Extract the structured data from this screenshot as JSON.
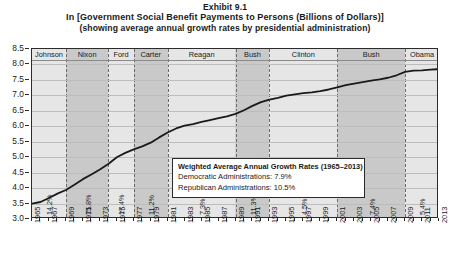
{
  "title": {
    "exhibit": "Exhibit 9.1",
    "main": "In [Government Social Benefit Payments to Persons (Billions of Dollars)]",
    "sub": "(showing average annual growth rates by presidential administration)"
  },
  "legend": {
    "title": "Weighted Average Annual Growth Rates (1965–2013)",
    "democratic": "Democratic Administrations: 7.9%",
    "republican": "Republican Administrations: 10.5%"
  },
  "chart_data": {
    "type": "line",
    "title": "In [Government Social Benefit Payments to Persons (Billions of Dollars)]",
    "subtitle": "(showing average annual growth rates by presidential administration)",
    "xlabel": "",
    "ylabel": "",
    "xlim": [
      1965,
      2013
    ],
    "ylim": [
      3.0,
      8.5
    ],
    "grid": true,
    "legend_position": "inside-center",
    "yticks": [
      "8.5",
      "8.0",
      "7.5",
      "7.0",
      "6.5",
      "6.0",
      "5.5",
      "5.0",
      "4.5",
      "4.0",
      "3.5",
      "3.0"
    ],
    "xticks": [
      "1965",
      "1967",
      "1969",
      "1971",
      "1973",
      "1975",
      "1977",
      "1979",
      "1981",
      "1983",
      "1985",
      "1987",
      "1989",
      "1991",
      "1993",
      "1995",
      "1997",
      "1999",
      "2001",
      "2003",
      "2005",
      "2007",
      "2009",
      "2011",
      "2013"
    ],
    "series": [
      {
        "name": "ln(Government Social Benefit Payments)",
        "color": "#1a1a1a",
        "x": [
          1965,
          1966,
          1967,
          1968,
          1969,
          1970,
          1971,
          1972,
          1973,
          1974,
          1975,
          1976,
          1977,
          1978,
          1979,
          1980,
          1981,
          1982,
          1983,
          1984,
          1985,
          1986,
          1987,
          1988,
          1989,
          1990,
          1991,
          1992,
          1993,
          1994,
          1995,
          1996,
          1997,
          1998,
          1999,
          2000,
          2001,
          2002,
          2003,
          2004,
          2005,
          2006,
          2007,
          2008,
          2009,
          2010,
          2011,
          2012,
          2013
        ],
        "values": [
          3.5,
          3.55,
          3.68,
          3.82,
          3.94,
          4.11,
          4.29,
          4.44,
          4.6,
          4.78,
          5.0,
          5.14,
          5.25,
          5.35,
          5.47,
          5.64,
          5.8,
          5.93,
          6.02,
          6.07,
          6.14,
          6.2,
          6.26,
          6.32,
          6.4,
          6.52,
          6.66,
          6.78,
          6.86,
          6.92,
          6.99,
          7.03,
          7.07,
          7.1,
          7.14,
          7.19,
          7.26,
          7.33,
          7.38,
          7.43,
          7.48,
          7.52,
          7.57,
          7.65,
          7.76,
          7.8,
          7.81,
          7.83,
          7.85
        ]
      }
    ],
    "administrations": [
      {
        "label": "Johnson",
        "party": "Democratic",
        "growth_rate": "14.2%",
        "start": 1965,
        "end": 1969,
        "shade": "light"
      },
      {
        "label": "Nixon",
        "party": "Republican",
        "growth_rate": "15.8%",
        "start": 1969,
        "end": 1974,
        "shade": "dark"
      },
      {
        "label": "Ford",
        "party": "Republican",
        "growth_rate": "17.4%",
        "start": 1974,
        "end": 1977,
        "shade": "light"
      },
      {
        "label": "Carter",
        "party": "Democratic",
        "growth_rate": "11.2%",
        "start": 1977,
        "end": 1981,
        "shade": "dark"
      },
      {
        "label": "Reagan",
        "party": "Republican",
        "growth_rate": "7.3%",
        "start": 1981,
        "end": 1989,
        "shade": "light"
      },
      {
        "label": "Bush",
        "party": "Republican",
        "growth_rate": "11.3%",
        "start": 1989,
        "end": 1993,
        "shade": "dark"
      },
      {
        "label": "Clinton",
        "party": "Democratic",
        "growth_rate": "4.5%",
        "start": 1993,
        "end": 2001,
        "shade": "light"
      },
      {
        "label": "Bush",
        "party": "Republican",
        "growth_rate": "7.4%",
        "start": 2001,
        "end": 2009,
        "shade": "dark"
      },
      {
        "label": "Obama",
        "party": "Democratic",
        "growth_rate": "5.4%",
        "start": 2009,
        "end": 2013,
        "shade": "light"
      }
    ],
    "annotations": {
      "weighted_avg_title": "Weighted Average Annual Growth Rates (1965–2013)",
      "democratic_avg": "7.9%",
      "republican_avg": "10.5%"
    }
  }
}
